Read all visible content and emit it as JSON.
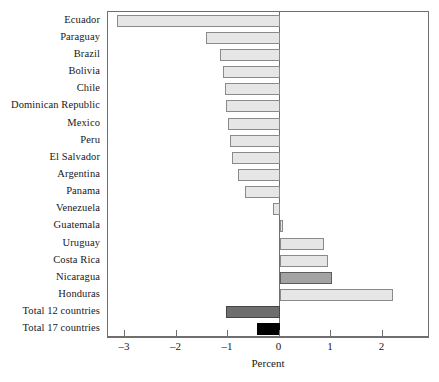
{
  "chart_data": {
    "type": "bar",
    "orientation": "horizontal",
    "title": "",
    "xlabel": "Percent",
    "ylabel": "",
    "xlim": [
      -3.33,
      2.92
    ],
    "xticks": [
      -3,
      -2,
      -1,
      0,
      1,
      2
    ],
    "xtick_labels": [
      "–3",
      "–2",
      "–1",
      "0",
      "1",
      "2"
    ],
    "grid": false,
    "legend": "none",
    "zero_reference_line": true,
    "categories": [
      "Ecuador",
      "Paraguay",
      "Brazil",
      "Bolivia",
      "Chile",
      "Dominican Republic",
      "Mexico",
      "Peru",
      "El Salvador",
      "Argentina",
      "Panama",
      "Venezuela",
      "Guatemala",
      "Uruguay",
      "Costa Rica",
      "Nicaragua",
      "Honduras",
      "Total 12 countries",
      "Total 17 countries"
    ],
    "values": [
      -3.16,
      -1.42,
      -1.16,
      -1.1,
      -1.06,
      -1.04,
      -1.0,
      -0.96,
      -0.92,
      -0.8,
      -0.68,
      -0.12,
      0.06,
      0.86,
      0.94,
      1.02,
      2.2,
      -1.04,
      -0.44
    ],
    "bar_styles": [
      "fill-light",
      "fill-light",
      "fill-light",
      "fill-light",
      "fill-light",
      "fill-light",
      "fill-light",
      "fill-light",
      "fill-light",
      "fill-light",
      "fill-light",
      "fill-light",
      "fill-light",
      "fill-light",
      "fill-light",
      "fill-mid",
      "fill-light",
      "fill-dark",
      "fill-black"
    ],
    "colors": {
      "default_bar_fill": "#e6e6e6",
      "default_bar_border": "#8a8a8a",
      "highlight_bar_fill": "#a3a3a3",
      "total12_bar_fill": "#6e6e6e",
      "total17_bar_fill": "#000000",
      "axis": "#6f6f6f",
      "text": "#181818",
      "background": "#ffffff"
    }
  }
}
